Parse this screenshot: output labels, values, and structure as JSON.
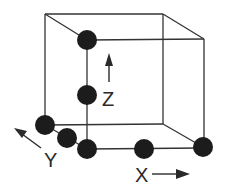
{
  "diagram": {
    "colors": {
      "line": "#333333",
      "atom": "#1c1c1c",
      "background": "#ffffff"
    },
    "axes": [
      {
        "label": "Z"
      },
      {
        "label": "Y"
      },
      {
        "label": "X"
      }
    ],
    "atoms": [
      {
        "name": "top-front-left",
        "cx": 87,
        "cy": 40
      },
      {
        "name": "mid-z",
        "cx": 87,
        "cy": 95
      },
      {
        "name": "back-bottom-left",
        "cx": 45,
        "cy": 125
      },
      {
        "name": "mid-y",
        "cx": 67,
        "cy": 138
      },
      {
        "name": "origin",
        "cx": 87,
        "cy": 149
      },
      {
        "name": "mid-x",
        "cx": 144,
        "cy": 149
      },
      {
        "name": "front-bottom-right",
        "cx": 203,
        "cy": 147
      }
    ]
  }
}
